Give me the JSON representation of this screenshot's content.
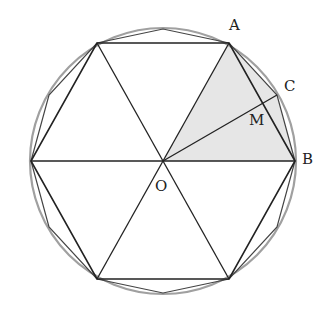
{
  "diagram": {
    "labels": {
      "A": "A",
      "B": "B",
      "C": "C",
      "M": "M",
      "O": "O"
    },
    "colors": {
      "circle": "#999999",
      "lines": "#2a2a2a",
      "shade": "#e8e8e8"
    }
  }
}
